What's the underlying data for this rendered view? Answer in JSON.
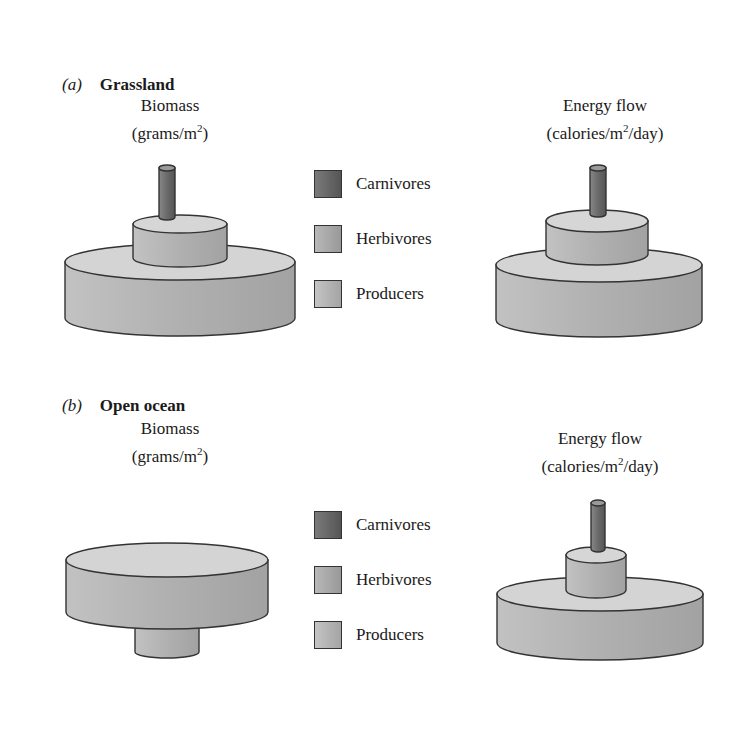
{
  "panels": [
    {
      "letter": "(a)",
      "title": "Grassland",
      "left": {
        "title_line1": "Biomass",
        "title_line2_pre": "(grams/m",
        "title_sup": "2",
        "title_line2_post": ")"
      },
      "right": {
        "title_line1": "Energy flow",
        "title_line2_pre": "(calories/m",
        "title_sup": "2",
        "title_line2_post": "/day)"
      }
    },
    {
      "letter": "(b)",
      "title": "Open ocean",
      "left": {
        "title_line1": "Biomass",
        "title_line2_pre": "(grams/m",
        "title_sup": "2",
        "title_line2_post": ")"
      },
      "right": {
        "title_line1": "Energy flow",
        "title_line2_pre": "(calories/m",
        "title_sup": "2",
        "title_line2_post": "/day)"
      }
    }
  ],
  "legend": [
    {
      "label": "Carnivores",
      "color": "#666666"
    },
    {
      "label": "Herbivores",
      "color": "#aaaaaa"
    },
    {
      "label": "Producers",
      "color": "#b4b4b4"
    }
  ],
  "colors": {
    "carnivore": "#6e6e6e",
    "herbivore": "#b0b0b0",
    "producer": "#b8b8b8",
    "top_light": "#d6d6d6",
    "outline": "#333333"
  }
}
